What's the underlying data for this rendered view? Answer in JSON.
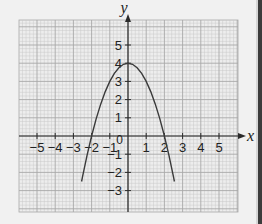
{
  "chart_data": {
    "type": "line",
    "title": "",
    "xlabel": "x",
    "ylabel": "y",
    "xlim": [
      -6.0,
      6.0
    ],
    "ylim": [
      -4.0,
      6.0
    ],
    "grid": true,
    "x_ticks": [
      -5,
      -4,
      -3,
      -2,
      -1,
      1,
      2,
      3,
      4,
      5
    ],
    "x_tick_labels": [
      "−5",
      "−4",
      "−3",
      "−2",
      "−1",
      "1",
      "2",
      "3",
      "4",
      "5"
    ],
    "y_ticks": [
      -3,
      -2,
      -1,
      1,
      2,
      3,
      4,
      5
    ],
    "y_tick_labels": [
      "−3",
      "−2",
      "−1",
      "1",
      "2",
      "3",
      "4",
      "5"
    ],
    "origin_label": "0",
    "series": [
      {
        "name": "y = 4 − x²",
        "x": [
          -2.55,
          -2.5,
          -2.25,
          -2.0,
          -1.75,
          -1.5,
          -1.25,
          -1.0,
          -0.75,
          -0.5,
          -0.25,
          0.0,
          0.25,
          0.5,
          0.75,
          1.0,
          1.25,
          1.5,
          1.75,
          2.0,
          2.25,
          2.5,
          2.55
        ],
        "y": [
          -2.5,
          -2.25,
          -1.06,
          0.0,
          0.94,
          1.75,
          2.44,
          3.0,
          3.44,
          3.75,
          3.94,
          4.0,
          3.94,
          3.75,
          3.44,
          3.0,
          2.44,
          1.75,
          0.94,
          0.0,
          -1.06,
          -2.25,
          -2.5
        ]
      }
    ],
    "annotations": {
      "vertex": [
        0,
        4
      ],
      "x_intercepts": [
        -2,
        2
      ]
    }
  },
  "page": {
    "side_mark": "?"
  },
  "colors": {
    "background": "#f1f1f1",
    "grid_minor": "#c9c9c9",
    "grid_major": "#a8a8a8",
    "axis": "#2a2a2a",
    "curve": "#3a3a3a",
    "text": "#222222"
  }
}
